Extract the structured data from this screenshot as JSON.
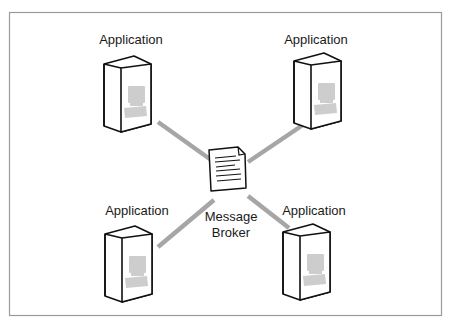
{
  "diagram": {
    "title": "",
    "frame_color": "#9a9a9a",
    "connector_color": "#a6a6a6",
    "computer_icon_color": "#cfcfcf",
    "center": {
      "label_line1": "Message",
      "label_line2": "Broker",
      "icon": "document-icon"
    },
    "nodes": [
      {
        "id": "app-top-left",
        "label": "Application",
        "icon": "computer-icon"
      },
      {
        "id": "app-top-right",
        "label": "Application",
        "icon": "computer-icon"
      },
      {
        "id": "app-bottom-left",
        "label": "Application",
        "icon": "computer-icon"
      },
      {
        "id": "app-bottom-right",
        "label": "Application",
        "icon": "computer-icon"
      }
    ]
  }
}
